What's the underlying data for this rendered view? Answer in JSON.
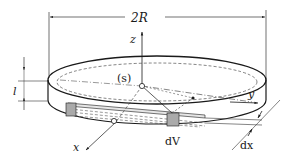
{
  "diagram": {
    "labels": {
      "diameter": "2R",
      "z_axis": "z",
      "y_axis": "y",
      "x_axis": "x",
      "thickness": "l",
      "surface": "(s)",
      "volume_element": "dV",
      "dx": "dx"
    },
    "colors": {
      "line": "#1a1a1a",
      "shaded": "#aaaaaa",
      "background": "#ffffff"
    }
  }
}
